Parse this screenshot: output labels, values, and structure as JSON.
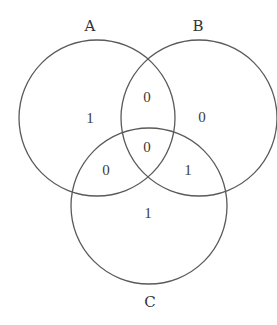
{
  "diagram": {
    "type": "venn",
    "stroke_color": "#5a5a5a",
    "text_color": "#333333",
    "sets": [
      {
        "id": "A",
        "label": "A",
        "cx": 97,
        "cy": 118,
        "r": 78,
        "label_x": 90,
        "label_y": 31
      },
      {
        "id": "B",
        "label": "B",
        "cx": 199,
        "cy": 118,
        "r": 78,
        "label_x": 198,
        "label_y": 31
      },
      {
        "id": "C",
        "label": "C",
        "cx": 149,
        "cy": 206,
        "r": 78,
        "label_x": 150,
        "label_y": 307
      }
    ],
    "regions": [
      {
        "name": "A-only",
        "value": "1",
        "x": 90,
        "y": 123
      },
      {
        "name": "A-and-B",
        "value": "0",
        "x": 147,
        "y": 102
      },
      {
        "name": "B-only",
        "value": "0",
        "x": 202,
        "y": 122
      },
      {
        "name": "A-and-B-and-C",
        "value": "0",
        "x": 147,
        "y": 152
      },
      {
        "name": "A-and-C",
        "value": "0",
        "x": 106,
        "y": 175
      },
      {
        "name": "B-and-C",
        "value": "1",
        "x": 188,
        "y": 175
      },
      {
        "name": "C-only",
        "value": "1",
        "x": 148,
        "y": 218
      }
    ]
  }
}
